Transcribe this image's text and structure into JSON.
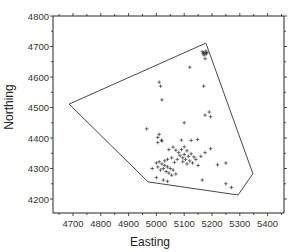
{
  "chart_data": {
    "type": "scatter",
    "title": "",
    "xlabel": "Easting",
    "ylabel": "Northing",
    "xlim": [
      4630,
      5470
    ],
    "ylim": [
      4150,
      4800
    ],
    "xticks": [
      4700,
      4800,
      4900,
      5000,
      5100,
      5200,
      5300,
      5400
    ],
    "yticks": [
      4200,
      4300,
      4400,
      4500,
      4600,
      4700,
      4800
    ],
    "grid": false,
    "legend": null,
    "series": [
      {
        "name": "observations",
        "marker": "+",
        "points": [
          [
            5165,
            4683
          ],
          [
            5170,
            4680
          ],
          [
            5175,
            4678
          ],
          [
            5180,
            4676
          ],
          [
            5172,
            4672
          ],
          [
            5178,
            4685
          ],
          [
            5168,
            4676
          ],
          [
            5182,
            4680
          ],
          [
            5175,
            4660
          ],
          [
            5120,
            4632
          ],
          [
            5010,
            4583
          ],
          [
            5015,
            4570
          ],
          [
            5170,
            4570
          ],
          [
            5020,
            4525
          ],
          [
            5175,
            4475
          ],
          [
            5190,
            4485
          ],
          [
            5195,
            4470
          ],
          [
            4965,
            4430
          ],
          [
            5100,
            4450
          ],
          [
            5005,
            4402
          ],
          [
            5010,
            4412
          ],
          [
            5018,
            4393
          ],
          [
            5005,
            4385
          ],
          [
            5020,
            4390
          ],
          [
            5090,
            4393
          ],
          [
            5148,
            4395
          ],
          [
            5125,
            4392
          ],
          [
            5045,
            4362
          ],
          [
            5060,
            4370
          ],
          [
            5070,
            4360
          ],
          [
            5080,
            4352
          ],
          [
            5090,
            4362
          ],
          [
            5100,
            4371
          ],
          [
            5110,
            4358
          ],
          [
            5100,
            4346
          ],
          [
            5085,
            4342
          ],
          [
            5095,
            4335
          ],
          [
            5105,
            4330
          ],
          [
            5115,
            4340
          ],
          [
            5125,
            4348
          ],
          [
            5135,
            4338
          ],
          [
            5120,
            4325
          ],
          [
            5130,
            4318
          ],
          [
            5110,
            4315
          ],
          [
            5095,
            4322
          ],
          [
            5075,
            4330
          ],
          [
            5065,
            4320
          ],
          [
            5055,
            4335
          ],
          [
            5142,
            4330
          ],
          [
            5160,
            4340
          ],
          [
            5175,
            4352
          ],
          [
            5010,
            4322
          ],
          [
            5020,
            4315
          ],
          [
            5030,
            4310
          ],
          [
            5040,
            4305
          ],
          [
            5025,
            4300
          ],
          [
            5015,
            4295
          ],
          [
            5005,
            4305
          ],
          [
            5035,
            4290
          ],
          [
            5050,
            4300
          ],
          [
            5060,
            4295
          ],
          [
            5045,
            4285
          ],
          [
            5055,
            4278
          ],
          [
            5070,
            4282
          ],
          [
            5000,
            4318
          ],
          [
            5030,
            4325
          ],
          [
            5040,
            4330
          ],
          [
            5195,
            4365
          ],
          [
            5150,
            4310
          ],
          [
            5220,
            4312
          ],
          [
            5250,
            4318
          ],
          [
            5040,
            4258
          ],
          [
            5025,
            4262
          ],
          [
            5165,
            4262
          ],
          [
            5250,
            4250
          ],
          [
            5270,
            4238
          ],
          [
            4985,
            4300
          ],
          [
            5000,
            4270
          ]
        ]
      }
    ],
    "hull_polygon": [
      [
        4686,
        4511
      ],
      [
        5178,
        4711
      ],
      [
        5347,
        4283
      ],
      [
        5294,
        4213
      ],
      [
        4970,
        4256
      ]
    ]
  },
  "axes": {
    "x_title": "Easting",
    "y_title": "Northing",
    "x_tick_labels": [
      "4700",
      "4800",
      "4900",
      "5000",
      "5100",
      "5200",
      "5300",
      "5400"
    ],
    "y_tick_labels": [
      "4200",
      "4300",
      "4400",
      "4500",
      "4600",
      "4700",
      "4800"
    ]
  },
  "colors": {
    "frame": "#222222",
    "polygon": "#333333",
    "marker": "#333333",
    "background": "#ffffff"
  }
}
